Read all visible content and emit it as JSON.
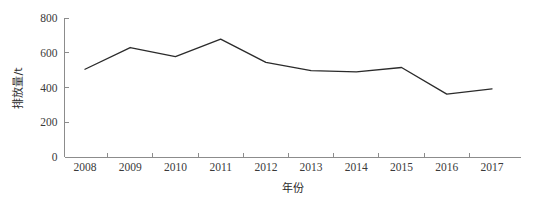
{
  "chart_data": {
    "type": "line",
    "title": "",
    "xlabel": "年份",
    "ylabel": "排放量/t",
    "categories": [
      "2008",
      "2009",
      "2010",
      "2011",
      "2012",
      "2013",
      "2014",
      "2015",
      "2016",
      "2017"
    ],
    "values": [
      505,
      630,
      578,
      678,
      545,
      497,
      490,
      515,
      362,
      392
    ],
    "series": [
      {
        "name": "排放量",
        "values": [
          505,
          630,
          578,
          678,
          545,
          497,
          490,
          515,
          362,
          392
        ]
      }
    ],
    "ylim": [
      0,
      800
    ],
    "ytick_labels": [
      "0",
      "200",
      "400",
      "600",
      "800"
    ],
    "ytick_values": [
      0,
      200,
      400,
      600,
      800
    ],
    "xtick_labels": [
      "2008",
      "2009",
      "2010",
      "2011",
      "2012",
      "2013",
      "2014",
      "2015",
      "2016",
      "2017"
    ],
    "grid": false,
    "legend": false,
    "legend_position": "none",
    "line_color": "#2b2b2b",
    "axis_color": "#8c8c8c",
    "background_color": "#ffffff",
    "markers": false
  }
}
